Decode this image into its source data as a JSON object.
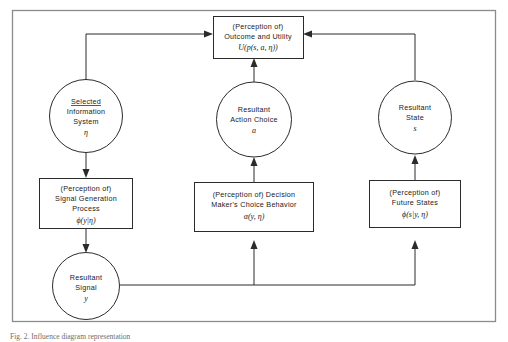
{
  "figure": {
    "caption": "Fig. 2. Influence diagram representation",
    "background_color": "#ffffff",
    "line_color": "#2b2b2b",
    "frame_color": "#8c8c8c"
  },
  "nodes": {
    "outcome_box": {
      "shape": "rectangle",
      "line1": "(Perception of)",
      "line2": "Outcome and Utility",
      "line3": "U(p(s, a, η))"
    },
    "selected_information_system": {
      "shape": "circle",
      "line1": "Selected",
      "line2": "Information",
      "line3": "System",
      "line4": "η"
    },
    "resultant_action_choice": {
      "shape": "circle",
      "line1": "Resultant",
      "line2": "Action Choice",
      "line3": "a"
    },
    "resultant_state": {
      "shape": "circle",
      "line1": "Resultant",
      "line2": "State",
      "line3": "s"
    },
    "signal_generation_box": {
      "shape": "rectangle",
      "line1": "(Perception of)",
      "line2": "Signal Generation",
      "line3": "Process",
      "line4": "ϕ(y|η)"
    },
    "choice_behavior_box": {
      "shape": "rectangle",
      "line1": "(Perception of) Decision",
      "line2": "Maker's Choice Behavior",
      "line3": "α(y, η)"
    },
    "future_states_box": {
      "shape": "rectangle",
      "line1": "(Perception of)",
      "line2": "Future States",
      "line3": "ϕ(s|y, η)"
    },
    "resultant_signal": {
      "shape": "circle",
      "line1": "Resultant",
      "line2": "Signal",
      "line3": "y"
    }
  },
  "edges": [
    {
      "name": "selected-system-to-outcome",
      "from": "selected_information_system",
      "to": "outcome_box"
    },
    {
      "name": "selected-system-to-signal-generation",
      "from": "selected_information_system",
      "to": "signal_generation_box"
    },
    {
      "name": "action-choice-to-outcome",
      "from": "resultant_action_choice",
      "to": "outcome_box"
    },
    {
      "name": "choice-behavior-to-action-choice",
      "from": "choice_behavior_box",
      "to": "resultant_action_choice"
    },
    {
      "name": "resultant-state-to-outcome",
      "from": "resultant_state",
      "to": "outcome_box"
    },
    {
      "name": "future-states-to-resultant-state",
      "from": "future_states_box",
      "to": "resultant_state"
    },
    {
      "name": "signal-generation-to-resultant-signal",
      "from": "signal_generation_box",
      "to": "resultant_signal"
    },
    {
      "name": "resultant-signal-to-choice-behavior",
      "from": "resultant_signal",
      "to": "choice_behavior_box"
    },
    {
      "name": "resultant-signal-to-future-states",
      "from": "resultant_signal",
      "to": "future_states_box"
    }
  ]
}
